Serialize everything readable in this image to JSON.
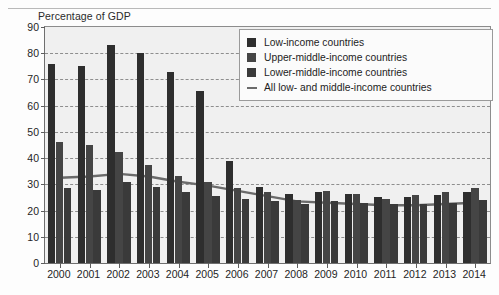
{
  "axis_title": "Percentage of GDP",
  "colors": {
    "low_income": "#2e2e2e",
    "upper_middle": "#454545",
    "lower_middle": "#3a3a3a",
    "line": "#6b6b6b",
    "plot_background": "#f0f0f0",
    "gridline": "#7d7d7d",
    "axis": "#5d5d5d"
  },
  "legend": {
    "items": [
      {
        "label": "Low-income countries",
        "marker": "square-swatch-icon"
      },
      {
        "label": "Upper-middle-income countries",
        "marker": "square-swatch-icon"
      },
      {
        "label": "Lower-middle-income countries",
        "marker": "square-swatch-icon"
      },
      {
        "label": "All low- and middle-income countries",
        "marker": "line-swatch-icon"
      }
    ]
  },
  "chart_data": {
    "type": "bar",
    "title": "",
    "xlabel": "",
    "ylabel": "Percentage of GDP",
    "ylim": [
      0,
      90
    ],
    "yticks": [
      0,
      10,
      20,
      30,
      40,
      50,
      60,
      70,
      80,
      90
    ],
    "grid": true,
    "legend_position": "top-right",
    "categories": [
      "2000",
      "2001",
      "2002",
      "2003",
      "2004",
      "2005",
      "2006",
      "2007",
      "2008",
      "2009",
      "2010",
      "2011",
      "2012",
      "2013",
      "2014"
    ],
    "series": [
      {
        "name": "Low-income countries",
        "type": "bar",
        "values": [
          76,
          75,
          83,
          80,
          73,
          65.5,
          39,
          29,
          26.5,
          27,
          26.5,
          25,
          25,
          26,
          27
        ]
      },
      {
        "name": "Upper-middle-income countries",
        "type": "bar",
        "values": [
          46,
          45,
          42.5,
          37.5,
          33,
          31,
          28.5,
          27,
          24,
          27.5,
          26.5,
          24.5,
          26,
          27,
          28.5
        ]
      },
      {
        "name": "Lower-middle-income countries",
        "type": "bar",
        "values": [
          28.5,
          28,
          31,
          29,
          27,
          25.5,
          24.5,
          23.5,
          22.5,
          23.5,
          23,
          22.5,
          22.5,
          23,
          24
        ]
      },
      {
        "name": "All low- and middle-income countries",
        "type": "line",
        "values": [
          32.5,
          33,
          34,
          33,
          31,
          29.5,
          27.5,
          25.5,
          23.5,
          23,
          22.5,
          22,
          22,
          22.5,
          23
        ]
      }
    ]
  }
}
